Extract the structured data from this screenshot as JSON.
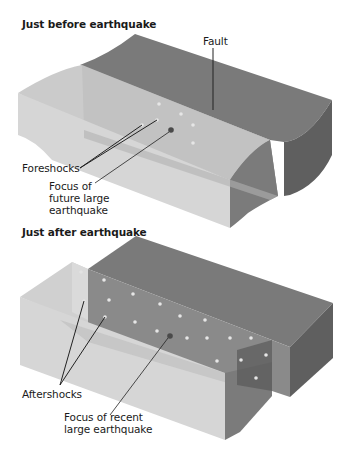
{
  "panels": [
    {
      "id": "before",
      "title": "Just before earthquake",
      "labels": {
        "fault": "Fault",
        "foreshocks": "Foreshocks",
        "focus": "Focus of\nfuture large\nearthquake"
      },
      "foreshock_dots": [
        [
          159,
          104
        ],
        [
          181,
          114
        ],
        [
          157,
          120
        ],
        [
          193,
          125
        ],
        [
          142,
          125
        ],
        [
          193,
          143
        ]
      ],
      "focus_point": [
        171,
        130
      ]
    },
    {
      "id": "after",
      "title": "Just after earthquake",
      "labels": {
        "aftershocks": "Aftershocks",
        "focus": "Focus of recent\nlarge earthquake"
      },
      "aftershock_dots": [
        [
          81,
          272
        ],
        [
          84,
          301
        ],
        [
          104,
          280
        ],
        [
          133,
          294
        ],
        [
          109,
          300
        ],
        [
          160,
          304
        ],
        [
          180,
          316
        ],
        [
          205,
          320
        ],
        [
          105,
          317
        ],
        [
          135,
          322
        ],
        [
          157,
          331
        ],
        [
          187,
          338
        ],
        [
          207,
          338
        ],
        [
          230,
          338
        ],
        [
          251,
          338
        ],
        [
          217,
          361
        ],
        [
          241,
          360
        ],
        [
          266,
          355
        ],
        [
          256,
          378
        ]
      ],
      "focus_point": [
        170,
        336
      ]
    }
  ],
  "colors": {
    "fault_plane": "#8c8c8c",
    "dark_face": "#6f6f6f",
    "light_block": "#d4d4d4",
    "light_top": "#c4c4c4",
    "dot": "#e6e6e6",
    "focus": "#4a4a4a",
    "leader": "#222222"
  }
}
